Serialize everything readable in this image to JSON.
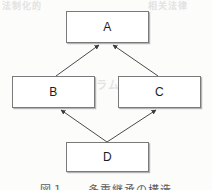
{
  "page": {
    "width": 212,
    "height": 190,
    "background_color": "#fcfcfb",
    "paper_type": "scanned-page"
  },
  "diagram": {
    "type": "directed-graph",
    "shape": "diamond-inheritance",
    "title": "",
    "line_color": "#4a4a4a",
    "box_border_color": "#7a7a7a",
    "box_fill_color": "#ffffff",
    "box_shadow_color": "#b4b4b4",
    "label_color": "#1c1c1c",
    "nodes": [
      {
        "id": "A",
        "label": "A",
        "x": 66,
        "y": 11,
        "width": 83,
        "height": 32
      },
      {
        "id": "B",
        "label": "B",
        "x": 12,
        "y": 76,
        "width": 83,
        "height": 32
      },
      {
        "id": "C",
        "label": "C",
        "x": 118,
        "y": 76,
        "width": 83,
        "height": 32
      },
      {
        "id": "D",
        "label": "D",
        "x": 66,
        "y": 142,
        "width": 83,
        "height": 30
      }
    ],
    "edges": [
      {
        "id": "b-to-a",
        "from": "B",
        "to": "A",
        "arrow": "to",
        "style": "solid"
      },
      {
        "id": "c-to-a",
        "from": "C",
        "to": "A",
        "arrow": "to",
        "style": "solid"
      },
      {
        "id": "d-to-b",
        "from": "D",
        "to": "B",
        "arrow": "to",
        "style": "solid"
      },
      {
        "id": "d-to-c",
        "from": "D",
        "to": "C",
        "arrow": "to",
        "style": "solid"
      }
    ]
  },
  "bleed_through": {
    "top_left": "法制化的",
    "top_right": "相关法律",
    "middle": "プログラム",
    "lower": "要求仕様"
  },
  "caption": {
    "text": "図１　　多重継承の構造"
  }
}
